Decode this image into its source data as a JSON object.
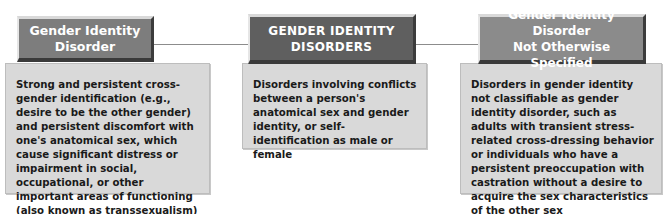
{
  "diagram": {
    "nodes": [
      {
        "id": "gender-identity-disorder",
        "title": "Gender Identity Disorder",
        "title_lines": [
          "Gender Identity Disorder"
        ],
        "description": "Strong and persistent cross-gender identification (e.g., desire to be the other gender) and persistent discomfort with one's anatomical sex, which cause significant distress or impairment in social, occupational, or other important areas of functioning (also known as transsexualism)",
        "header_color": "#7d7d7d"
      },
      {
        "id": "gender-identity-disorders",
        "title": "GENDER IDENTITY DISORDERS",
        "title_lines": [
          "GENDER IDENTITY",
          "DISORDERS"
        ],
        "description": "Disorders involving conflicts between a person's anatomical sex and gender identity, or self-identification as male or female",
        "header_color": "#5f5f5f"
      },
      {
        "id": "gender-identity-disorder-nos",
        "title": "Gender Identity Disorder Not Otherwise Specified",
        "title_lines": [
          "Gender Identity Disorder",
          "Not Otherwise Specified"
        ],
        "description": "Disorders in gender identity not classifiable as gender identity disorder, such as adults with transient stress-related cross-dressing behavior or individuals who have a persistent preoccupation with castration without a desire to acquire the sex characteristics of the other sex",
        "header_color": "#8b8b8b"
      }
    ],
    "edges": [
      {
        "from": "gender-identity-disorders",
        "to": "gender-identity-disorder"
      },
      {
        "from": "gender-identity-disorders",
        "to": "gender-identity-disorder-nos"
      }
    ],
    "colors": {
      "body_fill": "#d9d9d9",
      "connector": "#8c8c8c",
      "header_text": "#ffffff",
      "body_text": "#1a1a1a"
    }
  }
}
